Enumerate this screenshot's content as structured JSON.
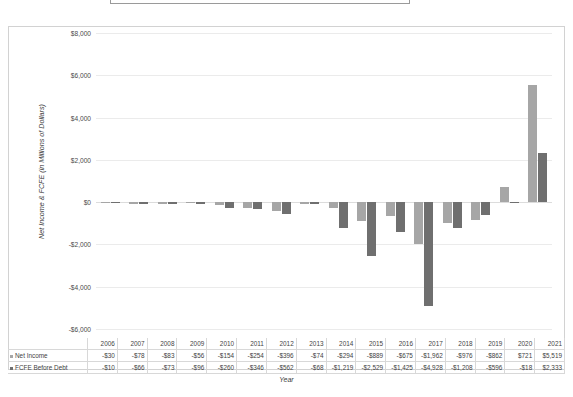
{
  "chart_data": {
    "type": "bar",
    "title": "",
    "xlabel": "Year",
    "ylabel": "Net Income & FCFE (in Millions of Dollars)",
    "ylim": [
      -6000,
      8000
    ],
    "ytick_labels": [
      "$8,000",
      "$6,000",
      "$4,000",
      "$2,000",
      "$0",
      "-$2,000",
      "-$4,000",
      "-$6,000"
    ],
    "ytick_values": [
      8000,
      6000,
      4000,
      2000,
      0,
      -2000,
      -4000,
      -6000
    ],
    "grid": true,
    "legend_position": "bottom-left-table",
    "categories": [
      "2006",
      "2007",
      "2008",
      "2009",
      "2010",
      "2011",
      "2012",
      "2013",
      "2014",
      "2015",
      "2016",
      "2017",
      "2018",
      "2019",
      "2020",
      "2021"
    ],
    "series": [
      {
        "name": "Net Income",
        "color": "#a6a6a6",
        "values": [
          -30,
          -78,
          -83,
          -56,
          -154,
          -254,
          -396,
          -74,
          -294,
          -889,
          -675,
          -1962,
          -976,
          -862,
          721,
          5519
        ],
        "labels": [
          "-$30",
          "-$78",
          "-$83",
          "-$56",
          "-$154",
          "-$254",
          "-$396",
          "-$74",
          "-$294",
          "-$889",
          "-$675",
          "-$1,962",
          "-$976",
          "-$862",
          "$721",
          "$5,519"
        ]
      },
      {
        "name": "FCFE Before Debt",
        "color": "#6f6f6f",
        "values": [
          -10,
          -66,
          -73,
          -96,
          -260,
          -346,
          -562,
          -68,
          -1219,
          -2529,
          -1425,
          -4928,
          -1208,
          -596,
          -18,
          2333
        ],
        "labels": [
          "-$10",
          "-$66",
          "-$73",
          "-$96",
          "-$260",
          "-$346",
          "-$562",
          "-$68",
          "-$1,219",
          "-$2,529",
          "-$1,425",
          "-$4,928",
          "-$1,208",
          "-$596",
          "-$18",
          "$2,333"
        ]
      }
    ]
  }
}
